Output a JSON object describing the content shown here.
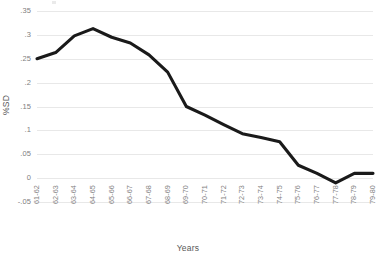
{
  "chart_data": {
    "type": "line",
    "title": "",
    "xlabel": "Years",
    "ylabel": "%SD",
    "categories": [
      "61-62",
      "62-63",
      "63-64",
      "64-65",
      "65-66",
      "66-67",
      "67-68",
      "68-69",
      "69-70",
      "70-71",
      "71-72",
      "72-73",
      "73-74",
      "74-75",
      "75-76",
      "76-77",
      "77-78",
      "78-79",
      "79-80"
    ],
    "values": [
      0.25,
      0.263,
      0.298,
      0.313,
      0.295,
      0.283,
      0.258,
      0.222,
      0.15,
      0.132,
      0.112,
      0.093,
      0.085,
      0.076,
      0.027,
      0.01,
      -0.01,
      0.01,
      0.01
    ],
    "ylim": [
      -0.05,
      0.35
    ],
    "y_ticks": [
      0.35,
      0.3,
      0.25,
      0.2,
      0.15,
      0.1,
      0.05,
      0,
      -0.05
    ],
    "y_tick_labels": [
      ".35",
      ".3",
      ".25",
      ".2",
      ".15",
      ".1",
      ".05",
      "0",
      "-.05"
    ],
    "grid": true,
    "legend": "none",
    "series_color": "#1a1a1a",
    "grid_color": "#e8e8e8",
    "text_color": "#808080"
  }
}
